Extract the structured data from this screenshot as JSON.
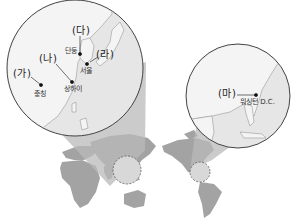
{
  "map": {
    "type": "world-map-with-insets",
    "colors": {
      "land": "#a3a3a3",
      "inset_land": "#f4f4f4",
      "inset_sea": "#e6e6e6",
      "beam": "#b9b9b9",
      "outline": "#555555",
      "text": "#222222"
    },
    "insets": [
      {
        "name": "east-asia",
        "points": [
          {
            "marker": "(가)",
            "city": "충칭"
          },
          {
            "marker": "(나)",
            "city": "상하이"
          },
          {
            "marker": "(다)",
            "city": "단둥"
          },
          {
            "marker": "(라)",
            "city": "서울"
          }
        ]
      },
      {
        "name": "eastern-united-states",
        "points": [
          {
            "marker": "(마)",
            "city": "워싱턴 D.C."
          }
        ]
      }
    ]
  }
}
